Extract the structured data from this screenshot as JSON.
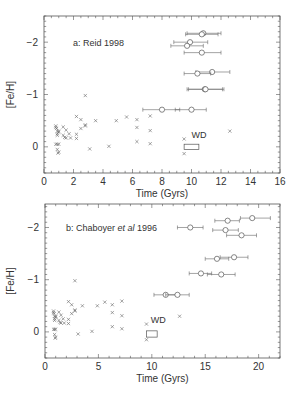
{
  "chart_data": [
    {
      "type": "scatter",
      "title": "a: Reid 1998",
      "xlabel": "Time (Gyrs)",
      "ylabel": "[Fe/H]",
      "xlim": [
        0,
        16
      ],
      "ylim": [
        0.5,
        -2.5
      ],
      "y_inverted": true,
      "xticks": [
        0,
        2,
        4,
        6,
        8,
        10,
        12,
        14,
        16
      ],
      "yticks": [
        0,
        -1,
        -2
      ],
      "ytick_labels": [
        "0",
        "−1",
        "−2"
      ],
      "annotation": "WD",
      "wd_box": {
        "x0": 9.5,
        "x1": 10.5,
        "y0": 0.05,
        "y1": -0.05
      },
      "crosses": [
        [
          0.8,
          -0.4
        ],
        [
          0.8,
          -0.37
        ],
        [
          0.85,
          -0.35
        ],
        [
          0.9,
          -0.3
        ],
        [
          0.9,
          -0.25
        ],
        [
          1.0,
          -0.3
        ],
        [
          1.0,
          -0.28
        ],
        [
          0.9,
          -0.22
        ],
        [
          0.8,
          -0.05
        ],
        [
          0.9,
          -0.05
        ],
        [
          1.0,
          -0.05
        ],
        [
          0.9,
          0.05
        ],
        [
          1.0,
          0.1
        ],
        [
          0.95,
          0.12
        ],
        [
          1.3,
          -0.38
        ],
        [
          1.5,
          -0.32
        ],
        [
          1.7,
          -0.25
        ],
        [
          1.3,
          -0.22
        ],
        [
          1.4,
          -0.18
        ],
        [
          1.5,
          -0.17
        ],
        [
          1.8,
          -0.17
        ],
        [
          2.2,
          -0.58
        ],
        [
          2.5,
          -0.52
        ],
        [
          2.2,
          -0.24
        ],
        [
          2.2,
          -0.16
        ],
        [
          2.5,
          -0.35
        ],
        [
          2.8,
          -0.4
        ],
        [
          2.8,
          -0.42
        ],
        [
          2.8,
          -0.98
        ],
        [
          3.1,
          0.04
        ],
        [
          3.5,
          -0.5
        ],
        [
          4.4,
          -0.01
        ],
        [
          4.9,
          -0.5
        ],
        [
          5.6,
          -0.57
        ],
        [
          6.3,
          -0.52
        ],
        [
          6.3,
          -0.37
        ],
        [
          6.3,
          -0.1
        ],
        [
          7.2,
          -0.59
        ],
        [
          7.2,
          -0.31
        ],
        [
          7.2,
          -0.06
        ],
        [
          9.5,
          -0.15
        ],
        [
          9.5,
          0.13
        ],
        [
          12.6,
          -0.3
        ]
      ],
      "circles": [
        {
          "x": 10.8,
          "y": -2.17,
          "xerr": [
            9.7,
            12.0
          ]
        },
        {
          "x": 10.7,
          "y": -2.15,
          "xerr": [
            9.6,
            11.8
          ]
        },
        {
          "x": 9.9,
          "y": -2.0,
          "xerr": [
            8.8,
            11.1
          ]
        },
        {
          "x": 9.7,
          "y": -1.93,
          "xerr": [
            8.6,
            10.8
          ]
        },
        {
          "x": 10.7,
          "y": -1.8,
          "xerr": [
            9.5,
            12.0
          ]
        },
        {
          "x": 11.4,
          "y": -1.43,
          "xerr": [
            10.3,
            12.6
          ]
        },
        {
          "x": 10.4,
          "y": -1.4,
          "xerr": [
            9.5,
            11.3
          ]
        },
        {
          "x": 10.9,
          "y": -1.1,
          "xerr": [
            9.7,
            12.2
          ]
        },
        {
          "x": 10.95,
          "y": -1.1,
          "xerr": [
            9.8,
            12.1
          ]
        },
        {
          "x": 8.0,
          "y": -0.71,
          "xerr": [
            6.7,
            9.2
          ]
        },
        {
          "x": 10.0,
          "y": -0.71,
          "xerr": [
            8.9,
            11.0
          ]
        }
      ]
    },
    {
      "type": "scatter",
      "title": "b: Chaboyer et al 1996",
      "title_parts": [
        "b: Chaboyer ",
        "et al",
        " 1996"
      ],
      "xlabel": "Time (Gyrs)",
      "ylabel": "[Fe/H]",
      "xlim": [
        0,
        22
      ],
      "ylim": [
        0.5,
        -2.45
      ],
      "y_inverted": true,
      "xticks": [
        0,
        5,
        10,
        15,
        20
      ],
      "yticks": [
        0,
        -1,
        -2
      ],
      "ytick_labels": [
        "0",
        "−1",
        "−2"
      ],
      "annotation": "WD",
      "wd_box": {
        "x0": 9.5,
        "x1": 10.5,
        "y0": 0.1,
        "y1": -0.02
      },
      "crosses": [
        [
          0.8,
          -0.4
        ],
        [
          0.8,
          -0.37
        ],
        [
          0.85,
          -0.35
        ],
        [
          0.9,
          -0.3
        ],
        [
          0.9,
          -0.25
        ],
        [
          1.0,
          -0.3
        ],
        [
          1.0,
          -0.28
        ],
        [
          0.9,
          -0.22
        ],
        [
          0.8,
          -0.05
        ],
        [
          0.9,
          -0.05
        ],
        [
          1.0,
          -0.05
        ],
        [
          0.9,
          0.05
        ],
        [
          1.0,
          0.1
        ],
        [
          0.95,
          0.12
        ],
        [
          1.3,
          -0.38
        ],
        [
          1.5,
          -0.32
        ],
        [
          1.7,
          -0.25
        ],
        [
          1.3,
          -0.22
        ],
        [
          1.4,
          -0.18
        ],
        [
          1.5,
          -0.17
        ],
        [
          1.8,
          -0.17
        ],
        [
          2.2,
          -0.58
        ],
        [
          2.5,
          -0.52
        ],
        [
          2.2,
          -0.24
        ],
        [
          2.2,
          -0.16
        ],
        [
          2.5,
          -0.35
        ],
        [
          2.8,
          -0.4
        ],
        [
          2.8,
          -0.42
        ],
        [
          2.8,
          -0.98
        ],
        [
          3.1,
          0.04
        ],
        [
          3.5,
          -0.5
        ],
        [
          4.4,
          -0.01
        ],
        [
          4.9,
          -0.5
        ],
        [
          5.6,
          -0.57
        ],
        [
          6.3,
          -0.52
        ],
        [
          6.3,
          -0.37
        ],
        [
          6.3,
          -0.1
        ],
        [
          7.2,
          -0.59
        ],
        [
          7.2,
          -0.31
        ],
        [
          7.2,
          -0.06
        ],
        [
          9.5,
          -0.15
        ],
        [
          9.5,
          0.15
        ],
        [
          12.6,
          -0.3
        ]
      ],
      "circles": [
        {
          "x": 19.4,
          "y": -2.18,
          "xerr": [
            18.3,
            21.1
          ]
        },
        {
          "x": 17.1,
          "y": -2.13,
          "xerr": [
            15.9,
            18.2
          ]
        },
        {
          "x": 13.6,
          "y": -2.0,
          "xerr": [
            12.4,
            14.8
          ]
        },
        {
          "x": 16.9,
          "y": -1.95,
          "xerr": [
            15.7,
            18.1
          ]
        },
        {
          "x": 18.4,
          "y": -1.85,
          "xerr": [
            17.0,
            19.8
          ]
        },
        {
          "x": 17.7,
          "y": -1.43,
          "xerr": [
            16.4,
            19.0
          ]
        },
        {
          "x": 16.1,
          "y": -1.4,
          "xerr": [
            15.0,
            17.2
          ]
        },
        {
          "x": 14.6,
          "y": -1.12,
          "xerr": [
            13.5,
            15.6
          ]
        },
        {
          "x": 16.5,
          "y": -1.1,
          "xerr": [
            15.2,
            17.8
          ]
        },
        {
          "x": 11.3,
          "y": -0.71,
          "xerr": [
            10.2,
            12.4
          ]
        },
        {
          "x": 12.4,
          "y": -0.71,
          "xerr": [
            11.3,
            13.5
          ]
        }
      ]
    }
  ],
  "layout": [
    {
      "left": 44,
      "right": 280,
      "top": 16,
      "bottom": 173
    },
    {
      "left": 45,
      "right": 280,
      "top": 204,
      "bottom": 358
    }
  ]
}
